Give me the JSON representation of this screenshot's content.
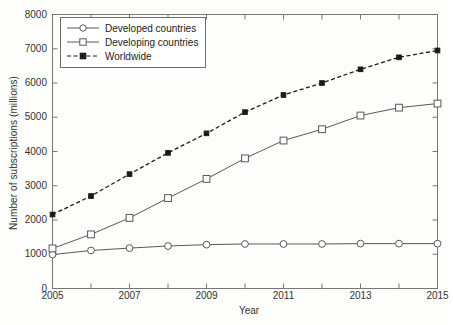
{
  "chart_data": {
    "type": "line",
    "title": "",
    "xlabel": "Year",
    "ylabel": "Number of subscriptions (millions)",
    "xlim": [
      2005,
      2015
    ],
    "ylim": [
      0,
      8000
    ],
    "xticks": [
      2005,
      2007,
      2009,
      2011,
      2013,
      2015
    ],
    "yticks": [
      0,
      1000,
      2000,
      3000,
      4000,
      5000,
      6000,
      7000,
      8000
    ],
    "minor_xticks": [
      2006,
      2008,
      2010,
      2012,
      2014
    ],
    "grid": false,
    "legend_position": "upper left",
    "x": [
      2005,
      2006,
      2007,
      2008,
      2009,
      2010,
      2011,
      2012,
      2013,
      2014,
      2015
    ],
    "series": [
      {
        "name": "Developed countries",
        "marker": "circle",
        "linestyle": "solid",
        "color": "#595959",
        "values": [
          990,
          1110,
          1180,
          1240,
          1280,
          1300,
          1300,
          1300,
          1310,
          1310,
          1310
        ]
      },
      {
        "name": "Developing countries",
        "marker": "square",
        "linestyle": "solid",
        "color": "#595959",
        "values": [
          1170,
          1580,
          2060,
          2640,
          3200,
          3800,
          4320,
          4650,
          5050,
          5280,
          5400
        ]
      },
      {
        "name": "Worldwide",
        "marker": "square-filled",
        "linestyle": "dashed",
        "color": "#1a1a1a",
        "values": [
          2160,
          2700,
          3340,
          3960,
          4530,
          5150,
          5650,
          6000,
          6400,
          6750,
          6950
        ]
      }
    ]
  },
  "legend": {
    "items": [
      {
        "label": "Developed countries"
      },
      {
        "label": "Developing countries"
      },
      {
        "label": "Worldwide"
      }
    ]
  },
  "axis": {
    "x_title": "Year",
    "y_title": "Number of subscriptions (millions)"
  },
  "colors": {
    "axis": "#777777",
    "series_gray": "#595959",
    "series_black": "#1a1a1a",
    "background": "#fdfdfc"
  }
}
